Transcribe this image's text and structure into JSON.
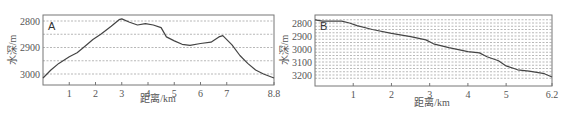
{
  "chart_data": [
    {
      "type": "line",
      "panel_label": "A",
      "title": "",
      "xlabel": "距离/km",
      "ylabel": "水深/m",
      "x_ticks": [
        "1",
        "2",
        "3",
        "4",
        "5",
        "6",
        "7",
        "8.8"
      ],
      "y_ticks": [
        "2800",
        "2900",
        "3000"
      ],
      "xlim": [
        0,
        8.8
      ],
      "ylim_inverted": [
        2805,
        3040
      ],
      "grid": "horizontal dashed every 50 m",
      "legend": "none",
      "x": [
        0,
        0.3,
        0.6,
        1.0,
        1.3,
        1.6,
        1.9,
        2.2,
        2.6,
        2.9,
        3.0,
        3.3,
        3.6,
        3.9,
        4.2,
        4.5,
        4.7,
        5.0,
        5.3,
        5.6,
        6.0,
        6.4,
        6.7,
        6.85,
        7.2,
        7.5,
        7.8,
        8.1,
        8.4,
        8.8
      ],
      "values": [
        3015,
        2985,
        2960,
        2935,
        2920,
        2895,
        2870,
        2850,
        2820,
        2795,
        2792,
        2805,
        2815,
        2810,
        2815,
        2825,
        2860,
        2875,
        2888,
        2892,
        2885,
        2880,
        2860,
        2855,
        2890,
        2930,
        2960,
        2985,
        3000,
        3015
      ]
    },
    {
      "type": "line",
      "panel_label": "B",
      "title": "",
      "xlabel": "距离/km",
      "ylabel": "水深/m",
      "x_ticks": [
        "1",
        "2",
        "3",
        "4",
        "5",
        "6.2"
      ],
      "y_ticks": [
        "2800",
        "2900",
        "3000",
        "3100",
        "3200"
      ],
      "xlim": [
        0,
        6.2
      ],
      "ylim_inverted": [
        2770,
        3240
      ],
      "grid": "horizontal dashed every 50 m",
      "legend": "none",
      "x": [
        0,
        0.2,
        0.5,
        0.7,
        0.9,
        1.1,
        1.5,
        2.0,
        2.5,
        2.9,
        3.1,
        3.5,
        4.0,
        4.3,
        4.5,
        4.8,
        5.0,
        5.3,
        5.6,
        6.0,
        6.2
      ],
      "values": [
        2775,
        2785,
        2785,
        2785,
        2800,
        2820,
        2850,
        2880,
        2905,
        2930,
        2960,
        2990,
        3020,
        3030,
        3060,
        3090,
        3130,
        3160,
        3170,
        3190,
        3215
      ]
    }
  ]
}
